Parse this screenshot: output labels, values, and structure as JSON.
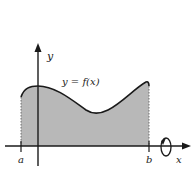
{
  "diagram": {
    "type": "solid-of-revolution-region",
    "curve_label": "y = f(x)",
    "axis_labels": {
      "x": "x",
      "y": "y"
    },
    "bounds": {
      "left": "a",
      "right": "b"
    },
    "rotation_axis": "x",
    "colors": {
      "region_fill": "#b8b8b8",
      "curve": "#1a1a1a",
      "axes": "#1a1a1a",
      "background": "#ffffff"
    }
  }
}
